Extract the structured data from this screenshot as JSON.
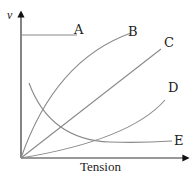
{
  "diagram": {
    "type": "graph-sketch",
    "y_axis_label": "v",
    "x_axis_label": "Tension",
    "curves": [
      {
        "id": "A",
        "label": "A",
        "shape": "horizontal-line"
      },
      {
        "id": "B",
        "label": "B",
        "shape": "concave-down-increasing"
      },
      {
        "id": "C",
        "label": "C",
        "shape": "straight-line-through-origin"
      },
      {
        "id": "D",
        "label": "D",
        "shape": "concave-up-increasing"
      },
      {
        "id": "E",
        "label": "E",
        "shape": "decreasing-hyperbolic"
      }
    ],
    "colors": {
      "axes": "#333333",
      "curves": "#8a8a8a",
      "text": "#222222"
    }
  }
}
